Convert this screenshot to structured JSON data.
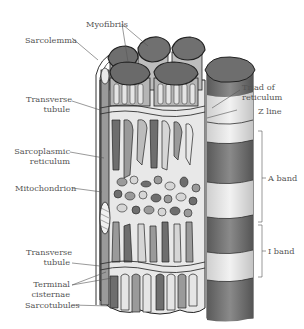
{
  "diagram": {
    "labels": {
      "myofibrils": "Myofibrils",
      "sarcolemma": "Sarcolemma",
      "transverse_tubule_top_1": "Transverse",
      "transverse_tubule_top_2": "tubule",
      "triad_1": "Triad of",
      "triad_2": "reticulum",
      "z_line": "Z line",
      "sarcoplasmic_1": "Sarcoplasmic",
      "sarcoplasmic_2": "reticulum",
      "mitochondrion": "Mitochondrion",
      "a_band": "A band",
      "i_band": "I band",
      "transverse_tubule_bottom_1": "Transverse",
      "transverse_tubule_bottom_2": "tubule",
      "terminal_cisternae_1": "Terminal",
      "terminal_cisternae_2": "cisternae",
      "sarcotubules": "Sarcotubules"
    },
    "colors": {
      "dark_fill": "#6e6e6e",
      "mid_fill": "#9a9a9a",
      "light_fill": "#d6d6d6",
      "outline": "#222222",
      "leader": "#555555"
    }
  }
}
